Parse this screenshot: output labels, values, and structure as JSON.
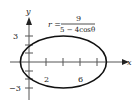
{
  "figure": {
    "equation": {
      "lhs": "r =",
      "numerator": "9",
      "denominator": "5 − 4cosθ"
    },
    "axes": {
      "x_label": "x",
      "y_label": "y",
      "x_ticks": [
        {
          "value": 2,
          "label": "2"
        },
        {
          "value": 6,
          "label": "6"
        }
      ],
      "y_ticks": [
        {
          "value": 3,
          "label": "3"
        },
        {
          "value": -3,
          "label": "−3"
        }
      ]
    },
    "curve": {
      "type": "ellipse",
      "center_x": 4,
      "center_y": 0,
      "semi_major": 5,
      "semi_minor": 3,
      "x_range": [
        -1,
        9
      ]
    },
    "colors": {
      "curve": "#111111",
      "axes": "#555555"
    }
  }
}
